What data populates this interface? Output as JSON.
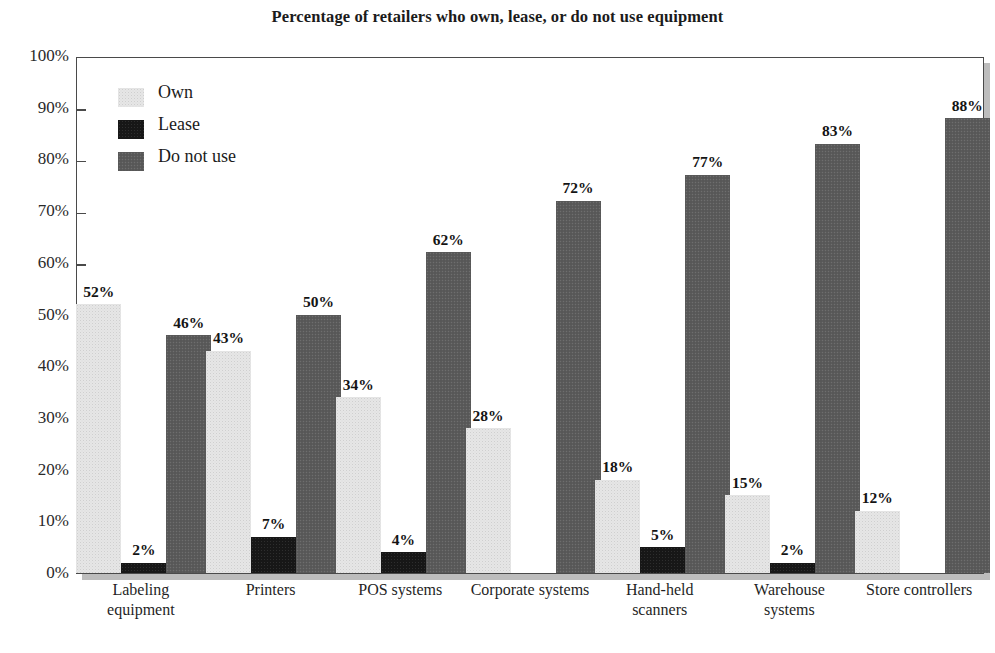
{
  "chart_data": {
    "type": "bar",
    "title": "Percentage of retailers who own, lease, or do not use equipment",
    "xlabel": "",
    "ylabel": "",
    "ylim": [
      0,
      100
    ],
    "y_tick_labels": [
      "100%",
      "90%",
      "80%",
      "70%",
      "60%",
      "50%",
      "40%",
      "30%",
      "20%",
      "10%",
      "0%"
    ],
    "y_tick_values": [
      100,
      90,
      80,
      70,
      60,
      50,
      40,
      30,
      20,
      10,
      0
    ],
    "grid": false,
    "legend_position": "upper-left-inside",
    "categories": [
      "Labeling equipment",
      "Printers",
      "POS systems",
      "Corporate systems",
      "Hand-held scanners",
      "Warehouse systems",
      "Store controllers"
    ],
    "category_label_lines": [
      [
        "Labeling",
        "equipment"
      ],
      [
        "Printers"
      ],
      [
        "POS systems"
      ],
      [
        "Corporate systems"
      ],
      [
        "Hand-held",
        "scanners"
      ],
      [
        "Warehouse",
        "systems"
      ],
      [
        "Store controllers"
      ]
    ],
    "series": [
      {
        "name": "Own",
        "color": "#e6e6e6",
        "values": [
          52,
          43,
          34,
          28,
          18,
          15,
          12
        ],
        "labels": [
          "52%",
          "43%",
          "34%",
          "28%",
          "18%",
          "15%",
          "12%"
        ]
      },
      {
        "name": "Lease",
        "color": "#171717",
        "values": [
          2,
          7,
          4,
          0,
          5,
          2,
          0
        ],
        "labels": [
          "2%",
          "7%",
          "4%",
          "",
          "5%",
          "2%",
          ""
        ]
      },
      {
        "name": "Do not use",
        "color": "#5b5b5b",
        "values": [
          46,
          50,
          62,
          72,
          77,
          83,
          88
        ],
        "labels": [
          "46%",
          "50%",
          "62%",
          "72%",
          "77%",
          "83%",
          "88%"
        ]
      }
    ]
  },
  "legend": {
    "items": [
      {
        "label": "Own",
        "swatch": "#e6e6e6",
        "swatch_class": "bar-own"
      },
      {
        "label": "Lease",
        "swatch": "#171717",
        "swatch_class": "bar-lease"
      },
      {
        "label": "Do not use",
        "swatch": "#5b5b5b",
        "swatch_class": "bar-dnu"
      }
    ]
  },
  "colors": {
    "own": "#e6e6e6",
    "lease": "#171717",
    "do_not_use": "#5b5b5b",
    "frame": "#4a4a4a",
    "shadow": "#bdbdbd",
    "text": "#1b1b1b",
    "background": "#ffffff"
  }
}
